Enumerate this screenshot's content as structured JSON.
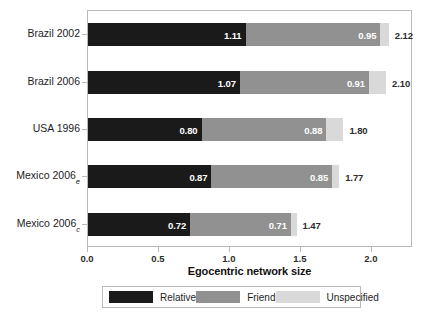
{
  "chart_data": {
    "type": "bar",
    "orientation": "horizontal",
    "stacked": true,
    "title": "",
    "xlabel": "Egocentric network size",
    "ylabel": "",
    "xlim": [
      0.0,
      2.29
    ],
    "xticks": [
      0.0,
      0.5,
      1.0,
      1.5,
      2.0
    ],
    "xtick_labels": [
      "0.0",
      "0.5",
      "1.0",
      "1.5",
      "2.0"
    ],
    "grid": false,
    "legend_position": "below",
    "categories": [
      {
        "label": "Brazil 2002",
        "base": "Brazil 2002",
        "sub": ""
      },
      {
        "label": "Brazil 2006",
        "base": "Brazil 2006",
        "sub": ""
      },
      {
        "label": "USA 1996",
        "base": "USA 1996",
        "sub": ""
      },
      {
        "label": "Mexico 2006e",
        "base": "Mexico 2006",
        "sub": "e"
      },
      {
        "label": "Mexico 2006c",
        "base": "Mexico 2006",
        "sub": "c"
      }
    ],
    "series": [
      {
        "name": "Relative",
        "color": "#1a1a1a",
        "values": [
          1.11,
          1.07,
          0.8,
          0.87,
          0.72
        ]
      },
      {
        "name": "Friend",
        "color": "#919191",
        "values": [
          0.95,
          0.91,
          0.88,
          0.85,
          0.71
        ]
      },
      {
        "name": "Unspecified",
        "color": "#d9d9d9",
        "values": [
          0.06,
          0.12,
          0.12,
          0.05,
          0.04
        ]
      }
    ],
    "segment_labels": [
      [
        "1.11",
        "0.95",
        ""
      ],
      [
        "1.07",
        "0.91",
        ""
      ],
      [
        "0.80",
        "0.88",
        ""
      ],
      [
        "0.87",
        "0.85",
        ""
      ],
      [
        "0.72",
        "0.71",
        ""
      ]
    ],
    "totals": [
      "2.12",
      "2.10",
      "1.80",
      "1.77",
      "1.47"
    ],
    "total_values": [
      2.12,
      2.1,
      1.8,
      1.77,
      1.47
    ]
  },
  "legend": {
    "items": [
      {
        "label": "Relative",
        "color": "#1a1a1a"
      },
      {
        "label": "Friend",
        "color": "#919191"
      },
      {
        "label": "Unspecified",
        "color": "#d9d9d9"
      }
    ]
  }
}
